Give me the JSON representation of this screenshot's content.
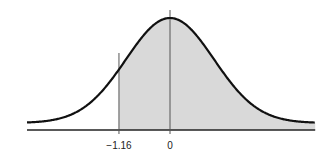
{
  "chart_data": {
    "type": "area",
    "title": "",
    "distribution": "standard normal",
    "mean": 0,
    "sd": 1,
    "shaded_region": {
      "from": -1.16,
      "to": "infinity"
    },
    "reference_lines": [
      {
        "x": -1.16,
        "label": "−1.16"
      },
      {
        "x": 0,
        "label": "0"
      }
    ],
    "xlabel": "",
    "ylabel": "",
    "x_range": [
      -3.25,
      3.3
    ],
    "grid": false,
    "legend": null,
    "colors": {
      "curve": "#111111",
      "shade": "#d9d9d9",
      "axis": "#222222",
      "reference_line": "#555555"
    }
  },
  "labels": {
    "tick_neg": "−1.16",
    "tick_zero": "0"
  }
}
